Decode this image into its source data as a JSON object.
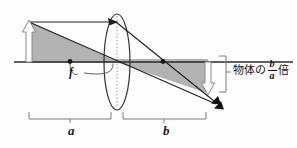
{
  "figure": {
    "type": "optics-ray-diagram",
    "width": 297,
    "height": 148,
    "background_color": "#fdfdfd"
  },
  "labels": {
    "object_distance": "a",
    "image_distance": "b",
    "focal_length": "f",
    "magnification_prefix": "物体の",
    "magnification_numerator": "b",
    "magnification_denominator": "a",
    "magnification_suffix": "倍",
    "magnification_full": "物体の b/a 倍"
  },
  "colors": {
    "stroke": "#1f1f1f",
    "axis": "#2a2a2a",
    "shade_fill": "#b3b3b3",
    "shade_stroke": "#8f8f8f",
    "hollow_arrow_fill": "#ffffff",
    "hollow_arrow_stroke": "#8a8a8a",
    "bracket": "#7d7d7d",
    "lens_stroke": "#333333",
    "lens_axis_dotted": "#9a9a9a",
    "text": "#161616"
  },
  "geometry": {
    "optical_axis_y": 62,
    "lens_center_x": 117,
    "lens_rx": 13,
    "lens_ry": 48,
    "object_base_x": 29,
    "object_top_y": 22,
    "image_base_x": 208,
    "image_bottom_y": 93,
    "focal_point_left_x": 70,
    "focal_point_right_x": 163,
    "converge_x": 212,
    "converge_y": 99
  },
  "elements": {
    "object_arrow": "upward hollow white arrow at left of lens",
    "image_arrow": "downward hollow white arrow at right of lens",
    "lens": "vertical ellipse representing converging lens",
    "parallel_ray": "horizontal ray from object tip to lens then refracted through focal point",
    "center_ray": "ray from object tip through lens center continuing straight",
    "shaded_triangles": "two gray similar triangles showing a and b proportions",
    "focal_points": "two dots on the optical axis",
    "bracket_a": "dimension bracket spanning object to lens",
    "bracket_b": "dimension bracket spanning lens to image",
    "bracket_magnification": "vertical bracket indicating image height"
  }
}
